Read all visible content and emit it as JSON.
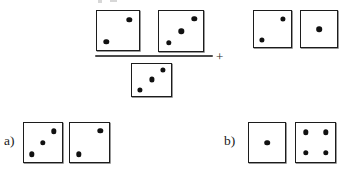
{
  "figure": {
    "type": "dice-arithmetic-puzzle",
    "background_color": "#ffffff",
    "die_border_color": "#1c1c1c",
    "pip_color": "#111111",
    "fraction_bar_color": "#4a4a4a"
  },
  "expression": {
    "plus_label": "+",
    "numerator": {
      "name": "numerator-dice-group",
      "dice": [
        {
          "name": "numerator-die-1",
          "value": 2,
          "x": 96,
          "y": 10,
          "w": 44,
          "h": 41,
          "pips": [
            {
              "cx": 0.77,
              "cy": 0.22,
              "r": 2.7
            },
            {
              "cx": 0.22,
              "cy": 0.79,
              "r": 2.7
            }
          ]
        },
        {
          "name": "numerator-die-2",
          "value": 3,
          "x": 158,
          "y": 10,
          "w": 46,
          "h": 42,
          "pips": [
            {
              "cx": 0.8,
              "cy": 0.2,
              "r": 2.7
            },
            {
              "cx": 0.51,
              "cy": 0.51,
              "r": 2.7
            },
            {
              "cx": 0.22,
              "cy": 0.8,
              "r": 2.7
            }
          ]
        }
      ]
    },
    "denominator": {
      "name": "denominator-dice-group",
      "dice": [
        {
          "name": "denominator-die-1",
          "value": 3,
          "x": 131,
          "y": 63,
          "w": 41,
          "h": 34,
          "pips": [
            {
              "cx": 0.8,
              "cy": 0.18,
              "r": 2.6
            },
            {
              "cx": 0.5,
              "cy": 0.48,
              "r": 2.6
            },
            {
              "cx": 0.2,
              "cy": 0.8,
              "r": 2.6
            }
          ]
        }
      ]
    },
    "addend": {
      "name": "addend-dice-group",
      "dice": [
        {
          "name": "addend-die-1",
          "value": 2,
          "x": 253,
          "y": 10,
          "w": 39,
          "h": 38,
          "pips": [
            {
              "cx": 0.78,
              "cy": 0.21,
              "r": 2.6
            },
            {
              "cx": 0.21,
              "cy": 0.8,
              "r": 2.6
            }
          ]
        },
        {
          "name": "addend-die-2",
          "value": 1,
          "x": 300,
          "y": 10,
          "w": 38,
          "h": 38,
          "pips": [
            {
              "cx": 0.5,
              "cy": 0.5,
              "r": 2.8
            }
          ]
        }
      ]
    },
    "fraction_bar": {
      "x": 95,
      "y": 55,
      "w": 118
    },
    "plus_position": {
      "x": 216,
      "y": 50
    }
  },
  "options": [
    {
      "name": "option-a",
      "label": "a)",
      "label_x": 4,
      "label_y": 134,
      "dice": [
        {
          "name": "option-a-die-1",
          "value": 3,
          "x": 23,
          "y": 122,
          "w": 40,
          "h": 41,
          "pips": [
            {
              "cx": 0.79,
              "cy": 0.21,
              "r": 2.7
            },
            {
              "cx": 0.5,
              "cy": 0.5,
              "r": 2.7
            },
            {
              "cx": 0.2,
              "cy": 0.8,
              "r": 2.7
            }
          ]
        },
        {
          "name": "option-a-die-2",
          "value": 2,
          "x": 69,
          "y": 122,
          "w": 41,
          "h": 41,
          "pips": [
            {
              "cx": 0.78,
              "cy": 0.2,
              "r": 2.7
            },
            {
              "cx": 0.22,
              "cy": 0.8,
              "r": 2.7
            }
          ]
        }
      ]
    },
    {
      "name": "option-b",
      "label": "b)",
      "label_x": 224,
      "label_y": 134,
      "dice": [
        {
          "name": "option-b-die-1",
          "value": 1,
          "x": 248,
          "y": 122,
          "w": 38,
          "h": 41,
          "pips": [
            {
              "cx": 0.5,
              "cy": 0.5,
              "r": 2.8
            }
          ]
        },
        {
          "name": "option-b-die-2",
          "value": 4,
          "x": 295,
          "y": 122,
          "w": 41,
          "h": 41,
          "pips": [
            {
              "cx": 0.25,
              "cy": 0.24,
              "r": 2.7
            },
            {
              "cx": 0.76,
              "cy": 0.24,
              "r": 2.7
            },
            {
              "cx": 0.25,
              "cy": 0.77,
              "r": 2.7
            },
            {
              "cx": 0.76,
              "cy": 0.77,
              "r": 2.7
            }
          ]
        }
      ]
    }
  ]
}
